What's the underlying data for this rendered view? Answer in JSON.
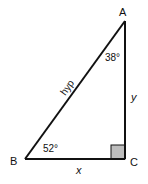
{
  "diagram": {
    "type": "right-triangle",
    "vertices": {
      "A": {
        "label": "A",
        "x": 125,
        "y": 21
      },
      "B": {
        "label": "B",
        "x": 25,
        "y": 159
      },
      "C": {
        "label": "C",
        "x": 125,
        "y": 159
      }
    },
    "angles": {
      "A": "38°",
      "B": "52°",
      "C": "right-angle"
    },
    "sides": {
      "hypotenuse": "hyp",
      "horizontal": "x",
      "vertical": "y"
    },
    "colors": {
      "line": "#111111",
      "right_angle_fill": "#bdbdbd",
      "background": "#ffffff"
    }
  }
}
